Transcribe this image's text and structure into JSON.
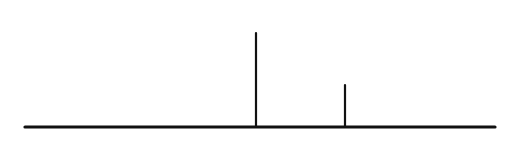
{
  "figure": {
    "type": "statistical-diagram",
    "background_color": "#ffffff",
    "ink_color": "#111111",
    "labels": {
      "probability_label": "P",
      "variable_label": "z"
    }
  },
  "chart_data": {
    "type": "area",
    "title": "",
    "xlabel": "",
    "ylabel": "",
    "grid": false,
    "legend": null,
    "curve_name": "normal-density",
    "axis_baseline_y": 127,
    "xlim": [
      25,
      495
    ],
    "ylim": [
      0,
      94
    ],
    "mean_x": 256,
    "peak_y": 40,
    "z_x": 345,
    "z_curve_y": 85,
    "shaded_region": {
      "from_x": 25,
      "to_x": 345,
      "fill": "diagonal-hatch",
      "hatch_angle_deg": 45,
      "hatch_spacing_px": 29
    },
    "curve_points": [
      {
        "x": 25,
        "y": 127
      },
      {
        "x": 45,
        "y": 126
      },
      {
        "x": 62,
        "y": 124
      },
      {
        "x": 80,
        "y": 120
      },
      {
        "x": 98,
        "y": 114
      },
      {
        "x": 116,
        "y": 107
      },
      {
        "x": 134,
        "y": 99
      },
      {
        "x": 152,
        "y": 91
      },
      {
        "x": 170,
        "y": 82
      },
      {
        "x": 188,
        "y": 72
      },
      {
        "x": 206,
        "y": 62
      },
      {
        "x": 224,
        "y": 52
      },
      {
        "x": 240,
        "y": 45
      },
      {
        "x": 256,
        "y": 40
      },
      {
        "x": 272,
        "y": 42
      },
      {
        "x": 288,
        "y": 48
      },
      {
        "x": 306,
        "y": 57
      },
      {
        "x": 324,
        "y": 70
      },
      {
        "x": 345,
        "y": 85
      },
      {
        "x": 362,
        "y": 95
      },
      {
        "x": 380,
        "y": 105
      },
      {
        "x": 398,
        "y": 113
      },
      {
        "x": 416,
        "y": 119
      },
      {
        "x": 434,
        "y": 123
      },
      {
        "x": 452,
        "y": 125
      },
      {
        "x": 470,
        "y": 127
      },
      {
        "x": 495,
        "y": 127
      }
    ],
    "hatch_baseline_intersections": [
      63,
      92,
      121,
      150,
      179,
      208,
      237,
      266,
      295,
      324,
      343
    ],
    "annotations": [
      {
        "text": "P",
        "x": 331,
        "y": 26,
        "leader_from": {
          "x": 318,
          "y": 24
        },
        "leader_to": {
          "x": 272,
          "y": 62
        }
      },
      {
        "text": "z",
        "x": 345,
        "y": 152,
        "tick_from": {
          "x": 345,
          "y": 127
        },
        "tick_to": {
          "x": 345,
          "y": 85
        }
      }
    ]
  }
}
